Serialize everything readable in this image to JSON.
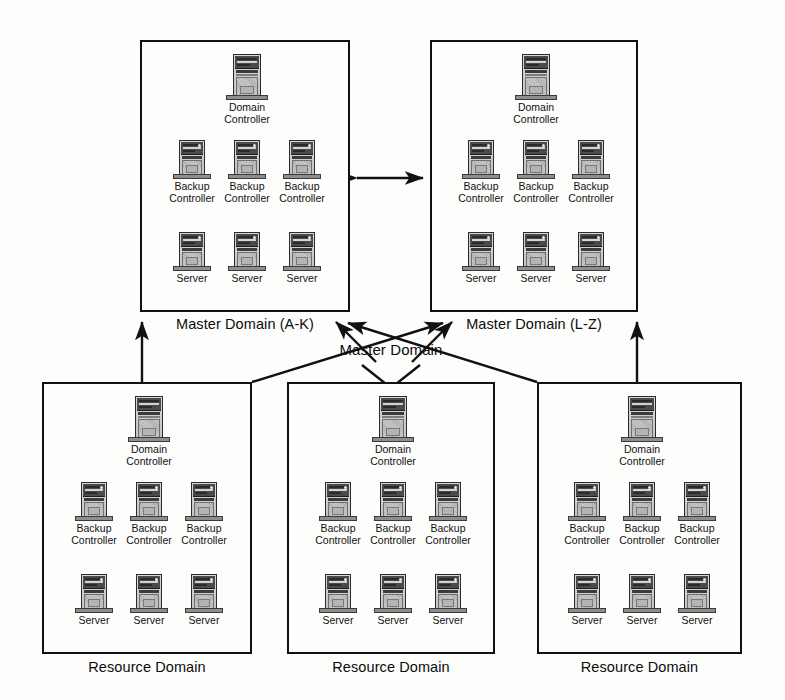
{
  "diagram": {
    "center_label": "Master Domain",
    "node_types": {
      "domain_controller": "Domain Controller",
      "backup_controller": "Backup\nController",
      "server": "Server"
    },
    "domains": [
      {
        "id": "master-a-k",
        "caption": "Master Domain (A-K)",
        "kind": "master",
        "x": 140,
        "y": 40,
        "w": 210,
        "h": 272,
        "nodes": {
          "controller": "Domain Controller",
          "backups": [
            "Backup\nController",
            "Backup\nController",
            "Backup\nController"
          ],
          "servers": [
            "Server",
            "Server",
            "Server"
          ]
        }
      },
      {
        "id": "master-l-z",
        "caption": "Master Domain (L-Z)",
        "kind": "master",
        "x": 430,
        "y": 40,
        "w": 208,
        "h": 272,
        "nodes": {
          "controller": "Domain Controller",
          "backups": [
            "Backup\nController",
            "Backup\nController",
            "Backup\nController"
          ],
          "servers": [
            "Server",
            "Server",
            "Server"
          ]
        }
      },
      {
        "id": "resource-1",
        "caption": "Resource Domain",
        "kind": "resource",
        "x": 42,
        "y": 382,
        "w": 210,
        "h": 272,
        "nodes": {
          "controller": "Domain Controller",
          "backups": [
            "Backup\nController",
            "Backup\nController",
            "Backup\nController"
          ],
          "servers": [
            "Server",
            "Server",
            "Server"
          ]
        }
      },
      {
        "id": "resource-2",
        "caption": "Resource Domain",
        "kind": "resource",
        "x": 287,
        "y": 382,
        "w": 208,
        "h": 272,
        "nodes": {
          "controller": "Domain Controller",
          "backups": [
            "Backup\nController",
            "Backup\nController",
            "Backup\nController"
          ],
          "servers": [
            "Server",
            "Server",
            "Server"
          ]
        }
      },
      {
        "id": "resource-3",
        "caption": "Resource Domain",
        "kind": "resource",
        "x": 537,
        "y": 382,
        "w": 205,
        "h": 272,
        "nodes": {
          "controller": "Domain Controller",
          "backups": [
            "Backup\nController",
            "Backup\nController",
            "Backup\nController"
          ],
          "servers": [
            "Server",
            "Server",
            "Server"
          ]
        }
      }
    ],
    "connections": [
      {
        "id": "trust-masters",
        "type": "bidirectional",
        "from": "master-a-k",
        "to": "master-l-z"
      },
      {
        "id": "r1-to-m1",
        "type": "arrow",
        "from": "resource-1",
        "to": "master-a-k"
      },
      {
        "id": "r2-to-m1",
        "type": "arrow",
        "from": "resource-2",
        "to": "master-a-k"
      },
      {
        "id": "r2-to-m2",
        "type": "arrow",
        "from": "resource-2",
        "to": "master-l-z"
      },
      {
        "id": "r3-to-m2",
        "type": "arrow",
        "from": "resource-3",
        "to": "master-l-z"
      },
      {
        "id": "r1-to-m2",
        "type": "arrow",
        "from": "resource-1",
        "to": "master-l-z"
      },
      {
        "id": "r3-to-m1",
        "type": "arrow",
        "from": "resource-3",
        "to": "master-a-k"
      }
    ],
    "colors": {
      "line": "#111111",
      "box_border": "#111111",
      "background": "#fdfdfc",
      "text": "#0c0c0c",
      "tower_body": "#c2c2c2",
      "tower_bezel": "#4a4a4a"
    }
  }
}
